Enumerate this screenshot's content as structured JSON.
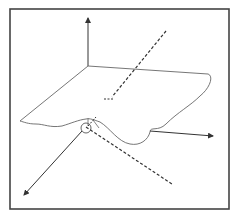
{
  "diagram": {
    "type": "3d-surface-with-axes",
    "frame": {
      "stroke": "#444444"
    },
    "colors": {
      "line": "#333333",
      "surface": "#666666",
      "background": "#ffffff"
    },
    "elements": [
      {
        "name": "vertical-axis",
        "style": "solid-arrow"
      },
      {
        "name": "right-axis",
        "style": "solid-arrow"
      },
      {
        "name": "front-left-axis",
        "style": "solid-arrow"
      },
      {
        "name": "surface-sheet",
        "style": "wavy-outline"
      },
      {
        "name": "upper-dashed-ray",
        "style": "dashed"
      },
      {
        "name": "lower-dashed-ray",
        "style": "dashed"
      },
      {
        "name": "origin-marker",
        "style": "small-circle"
      }
    ]
  }
}
